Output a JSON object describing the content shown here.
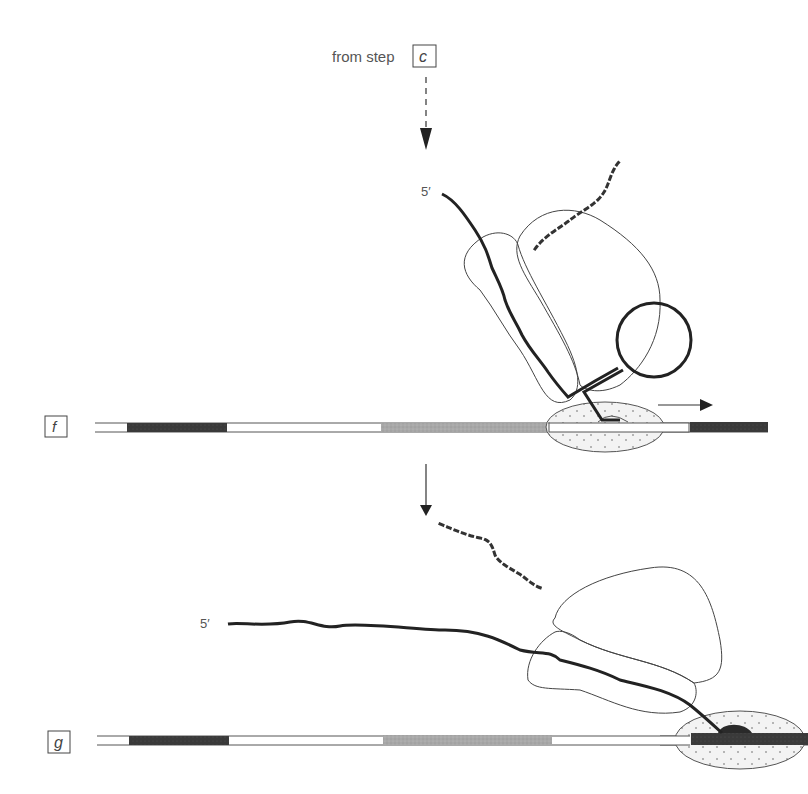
{
  "header": {
    "from_step_text": "from step",
    "from_step_letter": "c"
  },
  "steps": [
    {
      "id": "f",
      "label": "f",
      "five_prime_label": "5′"
    },
    {
      "id": "g",
      "label": "g",
      "five_prime_label": "5′"
    }
  ],
  "colors": {
    "dark_segment": "#3a3a3a",
    "gray_segment": "#a8a8a8",
    "white_segment": "#ffffff",
    "outline": "#555555",
    "strand": "#222222",
    "polymerase_fill": "#f2f2f2"
  },
  "icons": {
    "dashed_arrow": "dashed-down-arrow-icon",
    "solid_arrow": "down-arrow-icon",
    "direction_arrow": "right-arrow-icon"
  }
}
